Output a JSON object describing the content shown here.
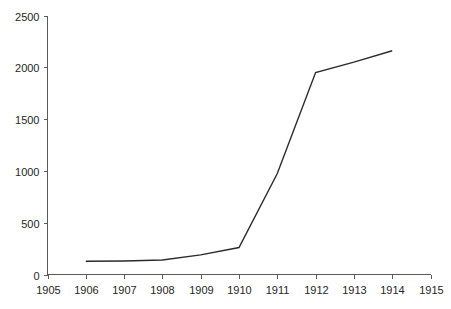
{
  "chart_data": {
    "type": "line",
    "title": "",
    "subtitle": "",
    "xlabel": "",
    "ylabel": "",
    "x": [
      1906,
      1907,
      1908,
      1909,
      1910,
      1911,
      1912,
      1913,
      1914
    ],
    "values": [
      128,
      130,
      140,
      190,
      260,
      975,
      1950,
      2050,
      2160
    ],
    "series": [
      {
        "name": "",
        "x": [
          1906,
          1907,
          1908,
          1909,
          1910,
          1911,
          1912,
          1913,
          1914
        ],
        "values": [
          128,
          130,
          140,
          190,
          260,
          975,
          1950,
          2050,
          2160
        ],
        "color": "#2b2b2b"
      }
    ],
    "xlim": [
      1905,
      1915
    ],
    "ylim": [
      0,
      2500
    ],
    "x_ticks": [
      1905,
      1906,
      1907,
      1908,
      1909,
      1910,
      1911,
      1912,
      1913,
      1914,
      1915
    ],
    "x_tick_labels": [
      "1905",
      "1906",
      "1907",
      "1908",
      "1909",
      "1910",
      "1911",
      "1912",
      "1913",
      "1914",
      "1915"
    ],
    "y_ticks": [
      0,
      500,
      1000,
      1500,
      2000,
      2500
    ],
    "y_tick_labels": [
      "0",
      "500",
      "1000",
      "1500",
      "2000",
      "2500"
    ],
    "grid": false,
    "legend": null,
    "legend_position": "none",
    "annotations": [],
    "colors": {
      "series": "#2b2b2b",
      "axis": "#5a5a5a",
      "text": "#262626",
      "background": "#ffffff"
    }
  }
}
